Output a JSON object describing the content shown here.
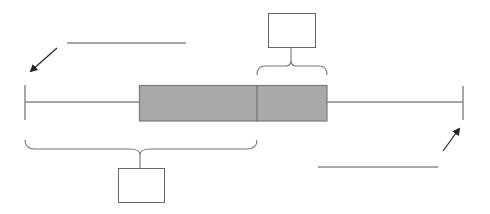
{
  "diagram": {
    "type": "box-and-whisker-plot-labeling-worksheet",
    "colors": {
      "background": "#ffffff",
      "box_fill": "#a9a9a9",
      "box_stroke": "#7a7a7a",
      "line": "#8a8a8a",
      "arrow": "#222222",
      "label_box_stroke": "#666666"
    },
    "box_plot": {
      "minimum_x": 25,
      "q1_x": 139,
      "median_x": 257,
      "q3_x": 327,
      "maximum_x": 463,
      "whisker_y": 102,
      "box_top": 85,
      "box_bottom": 121
    },
    "blanks": [
      {
        "name": "minimum-answer-line",
        "x1": 67,
        "x2": 186,
        "y": 43,
        "points_to": "minimum"
      },
      {
        "name": "maximum-answer-line",
        "x1": 318,
        "x2": 438,
        "y": 167,
        "points_to": "maximum"
      }
    ],
    "label_boxes": [
      {
        "name": "upper-quartile-range-box",
        "x": 268,
        "y": 13,
        "w": 47,
        "h": 34,
        "text": ""
      },
      {
        "name": "lower-half-range-box",
        "x": 118,
        "y": 168,
        "w": 46,
        "h": 34,
        "text": ""
      }
    ]
  }
}
